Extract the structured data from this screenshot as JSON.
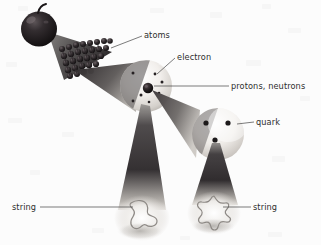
{
  "diagram": {
    "background_color": "#fcfcfc",
    "label_color": "#2e2e2e",
    "leader_color": "#444444",
    "labels": [
      {
        "id": "atoms",
        "text": "atoms",
        "x": 144,
        "y": 38,
        "anchor": "start"
      },
      {
        "id": "electron",
        "text": "electron",
        "x": 177,
        "y": 60,
        "anchor": "start"
      },
      {
        "id": "protons-neutrons",
        "text": "protons, neutrons",
        "x": 231,
        "y": 88,
        "anchor": "start"
      },
      {
        "id": "quark",
        "text": "quark",
        "x": 256,
        "y": 124,
        "anchor": "start"
      },
      {
        "id": "string-left",
        "text": "string",
        "x": 12,
        "y": 210,
        "anchor": "start"
      },
      {
        "id": "string-right",
        "text": "string",
        "x": 253,
        "y": 210,
        "anchor": "start"
      }
    ],
    "objects": [
      {
        "id": "apple",
        "name": "apple",
        "cx": 39,
        "cy": 28,
        "r": 18,
        "color": "#231f20"
      },
      {
        "id": "atom-lattice",
        "name": "crystal-lattice-of-atoms",
        "cx": 88,
        "cy": 58,
        "color": "#2a2628"
      },
      {
        "id": "atom-sphere",
        "name": "single-atom-sphere",
        "cx": 146,
        "cy": 86,
        "r": 26,
        "color": "#e7e4e0"
      },
      {
        "id": "nucleus",
        "name": "nucleus",
        "cx": 148,
        "cy": 88,
        "r": 5,
        "color": "#1a1718"
      },
      {
        "id": "nucleon-sphere",
        "name": "proton-neutron-sphere",
        "cx": 218,
        "cy": 134,
        "r": 26,
        "color": "#e7e4e0"
      },
      {
        "id": "string-loop-left",
        "name": "string-loop-blob",
        "cx": 142,
        "cy": 216,
        "color": "#9a9a9a"
      },
      {
        "id": "string-loop-right",
        "name": "string-loop-star",
        "cx": 214,
        "cy": 212,
        "color": "#9a9a9a"
      }
    ],
    "electrons": [
      {
        "cx": 133,
        "cy": 73
      },
      {
        "cx": 155,
        "cy": 74
      },
      {
        "cx": 162,
        "cy": 82
      },
      {
        "cx": 141,
        "cy": 95
      },
      {
        "cx": 133,
        "cy": 101
      },
      {
        "cx": 159,
        "cy": 93
      },
      {
        "cx": 149,
        "cy": 101
      }
    ],
    "quarks": [
      {
        "cx": 206,
        "cy": 123
      },
      {
        "cx": 228,
        "cy": 123
      },
      {
        "cx": 215,
        "cy": 140
      }
    ],
    "cones": [
      {
        "id": "cone-apple-to-atoms",
        "name": "magnification-cone-apple-to-atoms"
      },
      {
        "id": "cone-atoms-to-atom",
        "name": "magnification-cone-atoms-to-atom"
      },
      {
        "id": "cone-atom-to-nucleon",
        "name": "magnification-cone-atom-to-nucleon"
      },
      {
        "id": "cone-atom-to-string",
        "name": "magnification-cone-atom-to-string"
      },
      {
        "id": "cone-quark-to-string",
        "name": "magnification-cone-quark-to-string"
      }
    ]
  }
}
